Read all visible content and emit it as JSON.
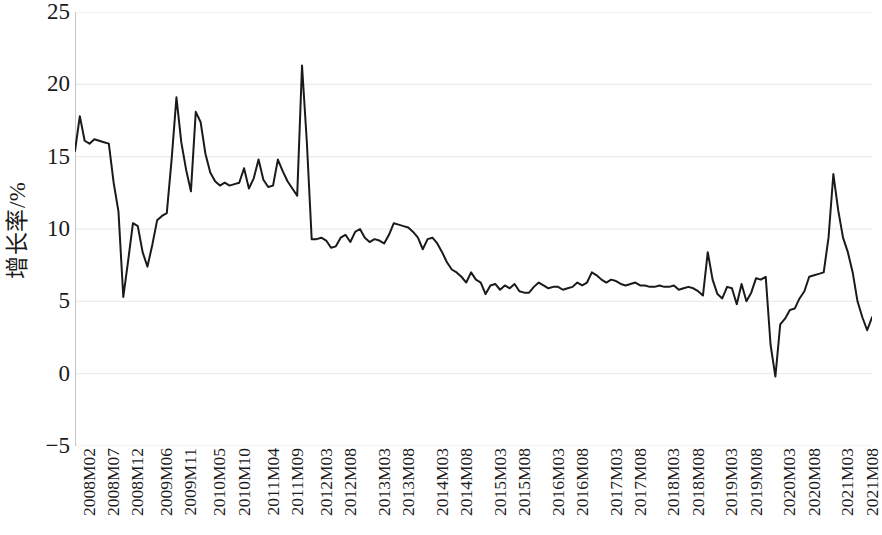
{
  "chart_data": {
    "type": "line",
    "title": "",
    "xlabel": "",
    "ylabel": "增长率/%",
    "ylim": [
      -5,
      25
    ],
    "yticks": [
      25,
      20,
      15,
      10,
      5,
      0,
      -5
    ],
    "grid": true,
    "legend": "none",
    "line_color": "#1a1a1a",
    "background_color": "#ffffff",
    "gridline_color": "#e8e8e8",
    "tick_labels": [
      "2008M02",
      "2008M07",
      "2008M12",
      "2009M06",
      "2009M11",
      "2010M05",
      "2010M10",
      "2011M04",
      "2011M09",
      "2012M03",
      "2012M08",
      "2013M03",
      "2013M08",
      "2014M03",
      "2014M08",
      "2015M03",
      "2015M08",
      "2016M03",
      "2016M08",
      "2017M03",
      "2017M08",
      "2018M03",
      "2018M08",
      "2019M03",
      "2019M08",
      "2020M03",
      "2020M08",
      "2021M03",
      "2021M08"
    ],
    "tick_label_indices": [
      0,
      5,
      10,
      16,
      21,
      27,
      32,
      38,
      43,
      49,
      54,
      61,
      66,
      73,
      78,
      85,
      90,
      97,
      102,
      109,
      114,
      121,
      126,
      133,
      138,
      145,
      150,
      157,
      162
    ],
    "x": [
      "2008M02",
      "2008M03",
      "2008M04",
      "2008M05",
      "2008M06",
      "2008M07",
      "2008M08",
      "2008M09",
      "2008M10",
      "2008M11",
      "2008M12",
      "2009M01",
      "2009M02",
      "2009M03",
      "2009M04",
      "2009M05",
      "2009M06",
      "2009M07",
      "2009M08",
      "2009M09",
      "2009M10",
      "2009M11",
      "2009M12",
      "2010M01",
      "2010M02",
      "2010M03",
      "2010M04",
      "2010M05",
      "2010M06",
      "2010M07",
      "2010M08",
      "2010M09",
      "2010M10",
      "2010M11",
      "2010M12",
      "2011M01",
      "2011M02",
      "2011M03",
      "2011M04",
      "2011M05",
      "2011M06",
      "2011M07",
      "2011M08",
      "2011M09",
      "2011M10",
      "2011M11",
      "2011M12",
      "2012M01",
      "2012M02",
      "2012M03",
      "2012M04",
      "2012M05",
      "2012M06",
      "2012M07",
      "2012M08",
      "2012M09",
      "2012M10",
      "2012M11",
      "2012M12",
      "2013M01",
      "2013M02",
      "2013M03",
      "2013M04",
      "2013M05",
      "2013M06",
      "2013M07",
      "2013M08",
      "2013M09",
      "2013M10",
      "2013M11",
      "2013M12",
      "2014M01",
      "2014M02",
      "2014M03",
      "2014M04",
      "2014M05",
      "2014M06",
      "2014M07",
      "2014M08",
      "2014M09",
      "2014M10",
      "2014M11",
      "2014M12",
      "2015M01",
      "2015M02",
      "2015M03",
      "2015M04",
      "2015M05",
      "2015M06",
      "2015M07",
      "2015M08",
      "2015M09",
      "2015M10",
      "2015M11",
      "2015M12",
      "2016M01",
      "2016M02",
      "2016M03",
      "2016M04",
      "2016M05",
      "2016M06",
      "2016M07",
      "2016M08",
      "2016M09",
      "2016M10",
      "2016M11",
      "2016M12",
      "2017M01",
      "2017M02",
      "2017M03",
      "2017M04",
      "2017M05",
      "2017M06",
      "2017M07",
      "2017M08",
      "2017M09",
      "2017M10",
      "2017M11",
      "2017M12",
      "2018M01",
      "2018M02",
      "2018M03",
      "2018M04",
      "2018M05",
      "2018M06",
      "2018M07",
      "2018M08",
      "2018M09",
      "2018M10",
      "2018M11",
      "2018M12",
      "2019M01",
      "2019M02",
      "2019M03",
      "2019M04",
      "2019M05",
      "2019M06",
      "2019M07",
      "2019M08",
      "2019M09",
      "2019M10",
      "2019M11",
      "2019M12",
      "2020M01",
      "2020M02",
      "2020M03",
      "2020M04",
      "2020M05",
      "2020M06",
      "2020M07",
      "2020M08",
      "2020M09",
      "2020M10",
      "2020M11",
      "2020M12",
      "2021M01",
      "2021M02",
      "2021M03",
      "2021M04",
      "2021M05",
      "2021M06",
      "2021M07",
      "2021M08",
      "2021M09",
      "2021M10",
      "2021M11"
    ],
    "values": [
      15.4,
      17.8,
      16.1,
      15.9,
      16.2,
      16.1,
      16.0,
      15.9,
      13.2,
      11.2,
      5.3,
      7.8,
      10.4,
      10.2,
      8.4,
      7.4,
      8.9,
      10.6,
      10.9,
      11.1,
      14.8,
      19.1,
      16.0,
      14.1,
      12.6,
      18.1,
      17.4,
      15.2,
      13.9,
      13.3,
      13.0,
      13.2,
      13.0,
      13.1,
      13.2,
      14.2,
      12.8,
      13.5,
      14.8,
      13.4,
      12.9,
      13.0,
      14.8,
      14.0,
      13.3,
      12.8,
      12.3,
      21.3,
      16.0,
      9.3,
      9.3,
      9.4,
      9.2,
      8.7,
      8.8,
      9.4,
      9.6,
      9.1,
      9.8,
      10.0,
      9.4,
      9.1,
      9.3,
      9.2,
      9.0,
      9.6,
      10.4,
      10.3,
      10.2,
      10.1,
      9.8,
      9.4,
      8.6,
      9.3,
      9.4,
      9.0,
      8.4,
      7.7,
      7.2,
      7.0,
      6.7,
      6.3,
      7.0,
      6.5,
      6.3,
      5.5,
      6.1,
      6.2,
      5.8,
      6.1,
      5.9,
      6.2,
      5.7,
      5.6,
      5.6,
      6.0,
      6.3,
      6.1,
      5.9,
      6.0,
      6.0,
      5.8,
      5.9,
      6.0,
      6.3,
      6.1,
      6.3,
      7.0,
      6.8,
      6.5,
      6.3,
      6.5,
      6.4,
      6.2,
      6.1,
      6.2,
      6.3,
      6.1,
      6.1,
      6.0,
      6.0,
      6.1,
      6.0,
      6.0,
      6.1,
      5.8,
      5.9,
      6.0,
      5.9,
      5.7,
      5.4,
      8.4,
      6.5,
      5.5,
      5.2,
      6.0,
      5.9,
      4.8,
      6.2,
      5.0,
      5.6,
      6.6,
      6.5,
      6.7,
      2.0,
      -0.2,
      3.4,
      3.8,
      4.4,
      4.5,
      5.2,
      5.7,
      6.7,
      6.8,
      6.9,
      7.0,
      9.4,
      13.8,
      11.3,
      9.4,
      8.4,
      7.0,
      5.0,
      3.9,
      3.0,
      3.9
    ]
  },
  "figure": {
    "width": 872,
    "height": 535
  }
}
